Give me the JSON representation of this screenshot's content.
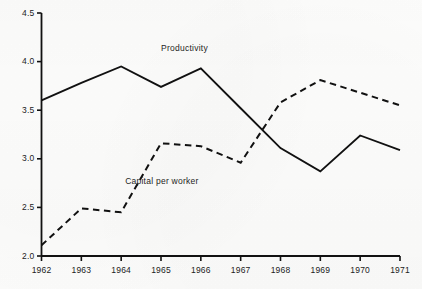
{
  "chart_data": {
    "type": "line",
    "title": "",
    "subtitle": "",
    "xlabel": "",
    "ylabel": "",
    "x": [
      1962,
      1963,
      1964,
      1965,
      1966,
      1967,
      1968,
      1969,
      1970,
      1971
    ],
    "categories": [
      "1962",
      "1963",
      "1964",
      "1965",
      "1966",
      "1967",
      "1968",
      "1969",
      "1970",
      "1971"
    ],
    "xlim": [
      1962,
      1971
    ],
    "ylim": [
      2.0,
      4.5
    ],
    "yticks": [
      2.0,
      2.5,
      3.0,
      3.5,
      4.0,
      4.5
    ],
    "ytick_labels": [
      "2.0",
      "2.5",
      "3.0",
      "3.5",
      "4.0",
      "4.5"
    ],
    "grid": false,
    "legend_position": "inline-annotations",
    "series": [
      {
        "name": "Productivity",
        "style": "solid",
        "color": "#111111",
        "values": [
          3.6,
          3.78,
          3.95,
          3.74,
          3.93,
          3.52,
          3.11,
          2.87,
          3.24,
          3.09
        ]
      },
      {
        "name": "Capital  per worker",
        "style": "dashed",
        "color": "#111111",
        "values": [
          2.11,
          2.49,
          2.45,
          3.16,
          3.13,
          2.96,
          3.58,
          3.81,
          3.68,
          3.55
        ]
      }
    ],
    "annotations": [
      {
        "text": "Productivity",
        "x": 1965.0,
        "y": 4.13
      },
      {
        "text": "Capital  per worker",
        "x": 1964.1,
        "y": 2.76
      }
    ]
  },
  "axes": {
    "y_axis_name": "value-axis",
    "x_axis_name": "year-axis"
  },
  "caption": {
    "text": ""
  }
}
